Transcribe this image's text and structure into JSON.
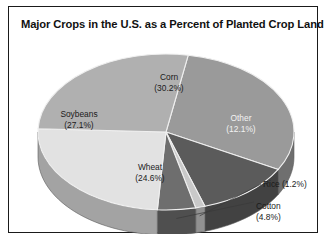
{
  "title": "Major Crops in the U.S. as a Percent of Planted Crop Land",
  "chart_data": {
    "type": "pie",
    "title": "Major Crops in the U.S. as a Percent of Planted Crop Land",
    "xlabel": "",
    "ylabel": "",
    "legend": "none",
    "grid": false,
    "three_d": true,
    "categories": [
      "Corn",
      "Other",
      "Rice",
      "Cotton",
      "Wheat",
      "Soybeans"
    ],
    "values": [
      30.2,
      12.1,
      1.2,
      4.8,
      24.6,
      27.1
    ],
    "unit": "percent",
    "colors": [
      "#9a9a9a",
      "#5b5b5b",
      "#c9c9c9",
      "#6e6e6e",
      "#e2e2e2",
      "#b0b0b0"
    ],
    "slices": [
      {
        "name": "Corn",
        "value": 30.2,
        "label": "Corn",
        "value_label": "(30.2%)",
        "color": "#9a9a9a",
        "label_placement": "inside",
        "label_color": "dark"
      },
      {
        "name": "Other",
        "value": 12.1,
        "label": "Other",
        "value_label": "(12.1%)",
        "color": "#5b5b5b",
        "label_placement": "inside",
        "label_color": "light"
      },
      {
        "name": "Rice",
        "value": 1.2,
        "label": "Rice",
        "value_label": "(1.2%)",
        "color": "#c9c9c9",
        "label_placement": "outside",
        "label_color": "dark"
      },
      {
        "name": "Cotton",
        "value": 4.8,
        "label": "Cotton",
        "value_label": "(4.8%)",
        "color": "#6e6e6e",
        "label_placement": "outside",
        "label_color": "dark"
      },
      {
        "name": "Wheat",
        "value": 24.6,
        "label": "Wheat",
        "value_label": "(24.6%)",
        "color": "#e2e2e2",
        "label_placement": "inside",
        "label_color": "dark"
      },
      {
        "name": "Soybeans",
        "value": 27.1,
        "label": "Soybeans",
        "value_label": "(27.1%)",
        "color": "#b0b0b0",
        "label_placement": "inside",
        "label_color": "dark"
      }
    ]
  },
  "labels": {
    "corn_name": "Corn",
    "corn_value": "(30.2%)",
    "other_name": "Other",
    "other_value": "(12.1%)",
    "soybeans_name": "Soybeans",
    "soybeans_value": "(27.1%)",
    "wheat_name": "Wheat",
    "wheat_value": "(24.6%)",
    "rice_combined": "Rice (1.2%)",
    "cotton_name": "Cotton",
    "cotton_value": "(4.8%)"
  },
  "colors": {
    "background": "#ffffff",
    "border": "#1a1a1a",
    "text": "#111111",
    "corn": "#9a9a9a",
    "other": "#5b5b5b",
    "rice": "#c9c9c9",
    "cotton": "#6e6e6e",
    "wheat": "#e2e2e2",
    "soybeans": "#b0b0b0"
  }
}
